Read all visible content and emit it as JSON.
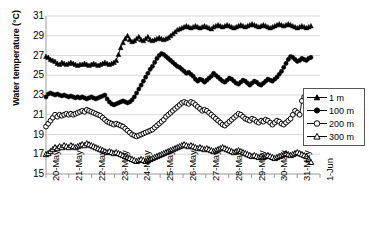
{
  "chart_data": {
    "type": "line",
    "title": "",
    "xlabel": "",
    "ylabel": "Water temperature (°C)",
    "ylim": [
      15,
      31
    ],
    "ytick_values": [
      15,
      17,
      19,
      21,
      23,
      25,
      27,
      29,
      31
    ],
    "ytick_labels": [
      "15",
      "17",
      "19",
      "21",
      "23",
      "25",
      "27",
      "29",
      "31"
    ],
    "xtick_labels": [
      "20-May",
      "21-May",
      "22-May",
      "23-May",
      "24-May",
      "25-May",
      "26-May",
      "27-May",
      "28-May",
      "29-May",
      "30-May",
      "31-May",
      "1-Jun"
    ],
    "x_start_label": "20-May",
    "x_end_label": "1-Jun",
    "grid": "horizontal",
    "legend_position": "right-middle",
    "series": [
      {
        "name": "1 m",
        "marker": "filled-triangle",
        "color": "#000000",
        "values": [
          26.9,
          26.8,
          26.6,
          26.5,
          26.4,
          26.2,
          26.1,
          26.3,
          26.2,
          26.1,
          26.2,
          26.3,
          26.2,
          26.1,
          26.0,
          26.1,
          26.1,
          26.2,
          26.1,
          26.0,
          26.1,
          26.2,
          26.1,
          26.0,
          26.1,
          26.2,
          26.3,
          26.2,
          26.1,
          26.2,
          26.3,
          26.5,
          27.1,
          27.8,
          28.3,
          28.7,
          29.0,
          28.6,
          28.4,
          28.5,
          28.7,
          28.9,
          28.6,
          28.5,
          28.7,
          28.9,
          28.6,
          28.5,
          28.6,
          28.7,
          28.8,
          28.7,
          28.6,
          28.7,
          28.8,
          29.0,
          29.2,
          29.4,
          29.6,
          29.7,
          29.8,
          29.9,
          30.0,
          29.9,
          29.8,
          29.9,
          30.0,
          29.9,
          29.8,
          29.9,
          30.0,
          29.9,
          29.8,
          29.7,
          29.9,
          30.0,
          30.1,
          30.0,
          29.9,
          30.0,
          30.1,
          30.0,
          29.9,
          29.8,
          29.9,
          30.0,
          30.1,
          30.0,
          29.9,
          30.0,
          30.1,
          30.2,
          30.1,
          30.0,
          29.9,
          30.0,
          30.1,
          30.0,
          29.9,
          29.8,
          29.9,
          30.0,
          30.1,
          30.2,
          30.1,
          30.0,
          30.1,
          30.2,
          30.1,
          30.0,
          29.9,
          29.8,
          29.9,
          30.0,
          29.9,
          29.8,
          29.9,
          30.0
        ]
      },
      {
        "name": "100 m",
        "marker": "filled-circle",
        "color": "#000000",
        "values": [
          22.8,
          23.1,
          23.2,
          23.1,
          23.0,
          23.1,
          23.0,
          22.9,
          23.0,
          22.9,
          22.8,
          22.9,
          22.8,
          22.7,
          22.8,
          22.7,
          22.8,
          22.7,
          22.6,
          22.7,
          22.8,
          22.7,
          22.6,
          22.7,
          22.8,
          22.9,
          23.0,
          22.6,
          22.3,
          22.1,
          22.0,
          22.1,
          22.2,
          22.3,
          22.4,
          22.3,
          22.2,
          22.3,
          22.5,
          22.8,
          23.2,
          23.6,
          24.0,
          24.4,
          24.8,
          25.2,
          25.6,
          25.9,
          26.3,
          26.7,
          27.0,
          27.2,
          27.1,
          26.9,
          26.7,
          26.5,
          26.3,
          26.1,
          25.9,
          25.8,
          25.6,
          25.4,
          25.2,
          25.3,
          25.1,
          24.9,
          24.6,
          24.4,
          24.6,
          24.5,
          24.3,
          24.5,
          24.7,
          24.9,
          25.2,
          25.0,
          24.8,
          24.6,
          24.4,
          24.3,
          24.5,
          24.7,
          24.6,
          24.4,
          24.2,
          24.1,
          24.3,
          24.5,
          24.4,
          24.2,
          24.0,
          24.2,
          24.4,
          24.3,
          24.1,
          24.0,
          24.2,
          24.4,
          24.6,
          24.5,
          24.4,
          24.6,
          24.8,
          25.1,
          25.4,
          25.8,
          26.2,
          26.6,
          26.9,
          26.8,
          26.6,
          26.4,
          26.5,
          26.7,
          26.6,
          26.5,
          26.7,
          26.8
        ]
      },
      {
        "name": "200 m",
        "marker": "open-circle",
        "color": "#000000",
        "values": [
          19.8,
          20.1,
          20.4,
          20.7,
          21.0,
          20.8,
          21.0,
          20.9,
          21.0,
          21.1,
          21.0,
          21.1,
          21.0,
          21.1,
          21.2,
          21.3,
          21.4,
          21.3,
          21.5,
          21.4,
          21.3,
          21.2,
          21.1,
          21.0,
          20.9,
          20.7,
          20.5,
          20.3,
          20.2,
          20.1,
          20.0,
          20.1,
          20.0,
          19.9,
          19.8,
          19.6,
          19.4,
          19.2,
          19.0,
          18.9,
          18.8,
          18.9,
          19.0,
          19.1,
          19.2,
          19.3,
          19.4,
          19.5,
          19.7,
          19.9,
          20.1,
          20.3,
          20.5,
          20.8,
          21.0,
          21.2,
          21.4,
          21.6,
          21.8,
          22.0,
          22.2,
          22.3,
          22.2,
          22.1,
          22.3,
          22.2,
          22.0,
          21.8,
          21.6,
          21.4,
          21.5,
          21.4,
          21.2,
          21.0,
          20.8,
          20.6,
          20.4,
          20.2,
          20.0,
          19.9,
          20.1,
          20.3,
          20.5,
          20.7,
          20.9,
          21.1,
          21.0,
          20.8,
          20.6,
          20.5,
          20.4,
          20.6,
          20.5,
          20.3,
          20.2,
          20.4,
          20.3,
          20.5,
          20.4,
          20.2,
          20.0,
          20.2,
          20.4,
          20.3,
          20.1,
          20.0,
          20.2,
          20.4,
          20.6,
          21.0,
          21.4,
          21.2,
          21.0,
          22.4,
          22.8,
          22.3,
          21.9,
          21.6,
          21.3,
          22.0,
          22.6,
          22.3
        ]
      },
      {
        "name": "300 m",
        "marker": "open-triangle",
        "color": "#000000",
        "values": [
          17.0,
          17.1,
          17.3,
          17.5,
          17.7,
          17.6,
          17.8,
          17.7,
          17.9,
          17.8,
          17.7,
          17.9,
          17.8,
          17.7,
          17.8,
          17.9,
          18.0,
          17.9,
          18.1,
          18.0,
          17.9,
          17.8,
          17.7,
          17.6,
          17.5,
          17.4,
          17.3,
          17.2,
          17.3,
          17.2,
          17.1,
          17.2,
          17.1,
          17.0,
          16.9,
          16.8,
          16.7,
          16.6,
          16.5,
          16.4,
          16.3,
          16.4,
          16.5,
          16.4,
          16.3,
          16.4,
          16.5,
          16.6,
          16.7,
          16.8,
          16.9,
          17.0,
          17.1,
          17.2,
          17.3,
          17.4,
          17.5,
          17.6,
          17.7,
          17.8,
          17.9,
          18.0,
          17.9,
          17.8,
          17.9,
          17.8,
          17.7,
          17.6,
          17.7,
          17.6,
          17.5,
          17.6,
          17.5,
          17.4,
          17.3,
          17.4,
          17.5,
          17.6,
          17.7,
          17.6,
          17.5,
          17.4,
          17.3,
          17.2,
          17.3,
          17.4,
          17.3,
          17.2,
          17.1,
          17.0,
          16.9,
          16.8,
          16.9,
          16.8,
          16.7,
          16.8,
          16.7,
          16.8,
          16.9,
          16.8,
          16.7,
          16.6,
          16.7,
          16.8,
          16.9,
          17.0,
          17.1,
          17.0,
          16.9,
          17.0,
          17.1,
          17.2,
          17.1,
          17.0,
          16.9,
          16.8,
          16.5,
          16.2
        ]
      }
    ],
    "legend": [
      {
        "label": "1 m",
        "marker": "filled-triangle"
      },
      {
        "label": "100 m",
        "marker": "filled-circle"
      },
      {
        "label": "200 m",
        "marker": "open-circle"
      },
      {
        "label": "300 m",
        "marker": "open-triangle"
      }
    ]
  }
}
